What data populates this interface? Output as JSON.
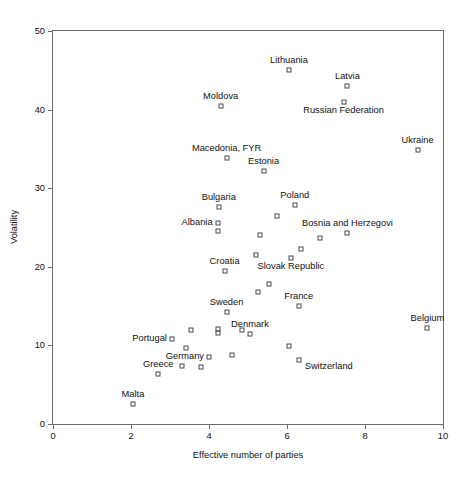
{
  "chart_data": {
    "type": "scatter",
    "title": "",
    "xlabel": "Effective number of parties",
    "ylabel": "Volatility",
    "xlim": [
      0,
      10
    ],
    "ylim": [
      0,
      50
    ],
    "xticks": [
      0,
      2,
      4,
      6,
      8,
      10
    ],
    "yticks": [
      0,
      10,
      20,
      30,
      40,
      50
    ],
    "grid": false,
    "legend": null,
    "marker": "open-square",
    "points": [
      {
        "label": "Lithuania",
        "x": 6.05,
        "y": 45.0,
        "label_pos": "above"
      },
      {
        "label": "Latvia",
        "x": 7.55,
        "y": 43.0,
        "label_pos": "above"
      },
      {
        "label": "Russian Federation",
        "x": 7.45,
        "y": 41.0,
        "label_pos": "below"
      },
      {
        "label": "Moldova",
        "x": 4.3,
        "y": 40.5,
        "label_pos": "above"
      },
      {
        "label": "Ukraine",
        "x": 9.35,
        "y": 34.8,
        "label_pos": "above"
      },
      {
        "label": "Macedonia, FYR",
        "x": 4.45,
        "y": 33.8,
        "label_pos": "above"
      },
      {
        "label": "Estonia",
        "x": 5.4,
        "y": 32.2,
        "label_pos": "above"
      },
      {
        "label": "Poland",
        "x": 6.2,
        "y": 27.8,
        "label_pos": "above"
      },
      {
        "label": "Bulgaria",
        "x": 4.25,
        "y": 27.6,
        "label_pos": "above"
      },
      {
        "label": "Albania",
        "x": 4.22,
        "y": 25.6,
        "label_pos": "left"
      },
      {
        "label": "",
        "x": 4.22,
        "y": 24.5,
        "label_pos": "none"
      },
      {
        "label": "",
        "x": 5.75,
        "y": 26.4,
        "label_pos": "none"
      },
      {
        "label": "",
        "x": 5.3,
        "y": 24.0,
        "label_pos": "none"
      },
      {
        "label": "Bosnia and Herzegovi",
        "x": 7.55,
        "y": 24.3,
        "label_pos": "above"
      },
      {
        "label": "",
        "x": 6.85,
        "y": 23.7,
        "label_pos": "none"
      },
      {
        "label": "",
        "x": 6.35,
        "y": 22.3,
        "label_pos": "none"
      },
      {
        "label": "",
        "x": 5.2,
        "y": 21.5,
        "label_pos": "none"
      },
      {
        "label": "Slovak Republic",
        "x": 6.1,
        "y": 21.1,
        "label_pos": "below"
      },
      {
        "label": "Croatia",
        "x": 4.4,
        "y": 19.5,
        "label_pos": "above"
      },
      {
        "label": "",
        "x": 5.55,
        "y": 17.8,
        "label_pos": "none"
      },
      {
        "label": "",
        "x": 5.25,
        "y": 16.8,
        "label_pos": "none"
      },
      {
        "label": "France",
        "x": 6.3,
        "y": 15.0,
        "label_pos": "above"
      },
      {
        "label": "Sweden",
        "x": 4.45,
        "y": 14.3,
        "label_pos": "above"
      },
      {
        "label": "Belgium",
        "x": 9.6,
        "y": 12.2,
        "label_pos": "above"
      },
      {
        "label": "",
        "x": 3.55,
        "y": 12.0,
        "label_pos": "none"
      },
      {
        "label": "",
        "x": 4.22,
        "y": 12.1,
        "label_pos": "none"
      },
      {
        "label": "",
        "x": 4.22,
        "y": 11.6,
        "label_pos": "none"
      },
      {
        "label": "",
        "x": 4.85,
        "y": 12.0,
        "label_pos": "none"
      },
      {
        "label": "Denmark",
        "x": 5.05,
        "y": 11.4,
        "label_pos": "above"
      },
      {
        "label": "Portugal",
        "x": 3.05,
        "y": 10.8,
        "label_pos": "left"
      },
      {
        "label": "",
        "x": 3.4,
        "y": 9.7,
        "label_pos": "none"
      },
      {
        "label": "",
        "x": 6.05,
        "y": 9.9,
        "label_pos": "none"
      },
      {
        "label": "Germany",
        "x": 4.0,
        "y": 8.5,
        "label_pos": "left"
      },
      {
        "label": "",
        "x": 4.6,
        "y": 8.8,
        "label_pos": "none"
      },
      {
        "label": "Switzerland",
        "x": 6.3,
        "y": 8.2,
        "label_pos": "right"
      },
      {
        "label": "",
        "x": 3.3,
        "y": 7.4,
        "label_pos": "none"
      },
      {
        "label": "",
        "x": 3.8,
        "y": 7.3,
        "label_pos": "none"
      },
      {
        "label": "Greece",
        "x": 2.7,
        "y": 6.4,
        "label_pos": "above"
      },
      {
        "label": "Malta",
        "x": 2.05,
        "y": 2.6,
        "label_pos": "above"
      }
    ]
  },
  "caption": ""
}
